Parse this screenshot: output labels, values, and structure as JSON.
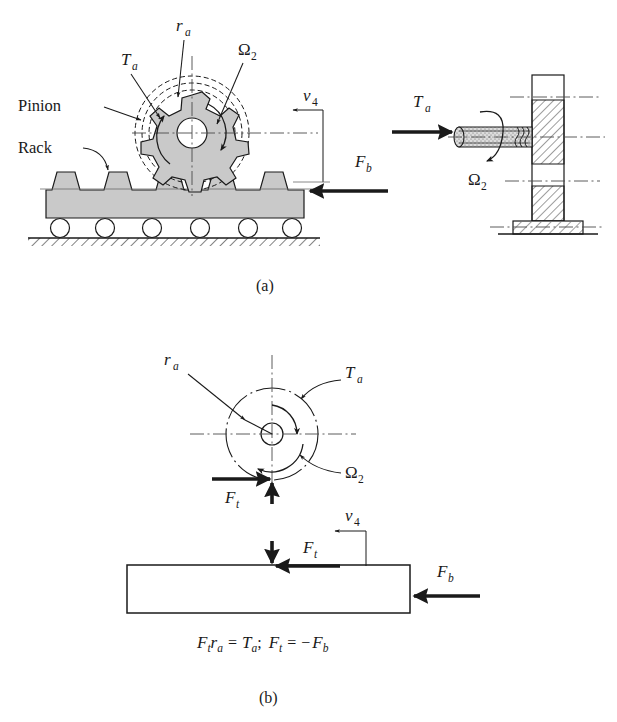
{
  "figure": {
    "background_color": "#ffffff",
    "line_color": "#1a1a1a",
    "body_fill_color": "#c9c9c9",
    "panels": [
      {
        "id": "a",
        "caption": "(a)",
        "labels": [
          "Pinion",
          "Rack",
          "T",
          "a",
          "r",
          "a",
          "Ω",
          "2",
          "v",
          "4",
          "F",
          "b"
        ]
      },
      {
        "id": "b",
        "caption": "(b)",
        "equation": "Fₜrₐ = Tₐ;  Fₜ = −Fᵇ"
      }
    ]
  },
  "panel_a": {
    "label_pinion": "Pinion",
    "label_rack": "Rack",
    "torque_symbol": "T",
    "torque_sub": "a",
    "radius_symbol": "r",
    "radius_sub": "a",
    "omega_symbol": "Ω",
    "omega_sub": "2",
    "velocity_symbol": "v",
    "velocity_sub": "4",
    "force_b_symbol": "F",
    "force_b_sub": "b",
    "shaft_torque_symbol": "T",
    "shaft_torque_sub": "a",
    "shaft_omega_symbol": "Ω",
    "shaft_omega_sub": "2",
    "caption": "(a)",
    "rack_teeth_count": 9,
    "roller_count": 6
  },
  "panel_b": {
    "radius_symbol": "r",
    "radius_sub": "a",
    "torque_symbol": "T",
    "torque_sub": "a",
    "omega_symbol": "Ω",
    "omega_sub": "2",
    "force_t_symbol": "F",
    "force_t_sub": "t",
    "force_t2_symbol": "F",
    "force_t2_sub": "t",
    "velocity_symbol": "v",
    "velocity_sub": "4",
    "force_b_symbol": "F",
    "force_b_sub": "b",
    "equation_parts": {
      "p1": "F",
      "p1s": "t",
      "p2": "r",
      "p2s": "a",
      "p3": "=",
      "p4": "T",
      "p4s": "a",
      "p5": ";",
      "p6": "F",
      "p6s": "t",
      "p7": "=",
      "p8": "−",
      "p9": "F",
      "p9s": "b"
    },
    "caption": "(b)"
  }
}
